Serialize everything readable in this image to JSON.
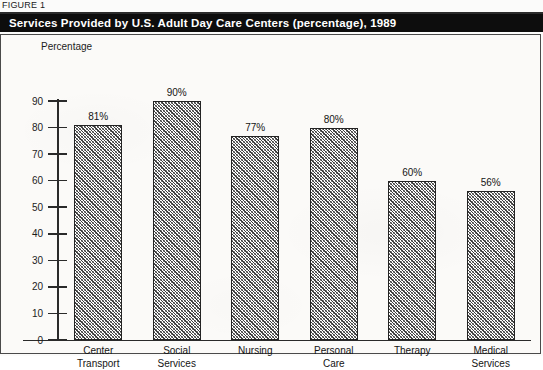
{
  "figure": {
    "label": "FIGURE 1",
    "title": "Services Provided by U.S. Adult Day Care Centers (percentage), 1989"
  },
  "chart_data": {
    "type": "bar",
    "title": "Services Provided by U.S. Adult Day Care Centers (percentage), 1989",
    "xlabel": "",
    "ylabel": "Percentage",
    "ylim": [
      0,
      90
    ],
    "ytick_step": 10,
    "yticks": [
      90,
      80,
      70,
      60,
      50,
      40,
      30,
      20,
      10,
      0
    ],
    "ytick_labels": [
      "90",
      "80",
      "70",
      "60",
      "50",
      "40",
      "30",
      "20",
      "10",
      "0"
    ],
    "grid": false,
    "legend": false,
    "categories": [
      "Center\nTransport",
      "Social\nServices",
      "Nursing",
      "Personal\nCare",
      "Therapy",
      "Medical\nServices"
    ],
    "values": [
      81,
      90,
      77,
      80,
      60,
      56
    ],
    "data_labels": [
      "81%",
      "90%",
      "77%",
      "80%",
      "60%",
      "56%"
    ],
    "bar_fill": "diagonal-crosshatch",
    "bar_border_color": "#232323",
    "background_color": "#fbfaf8"
  }
}
